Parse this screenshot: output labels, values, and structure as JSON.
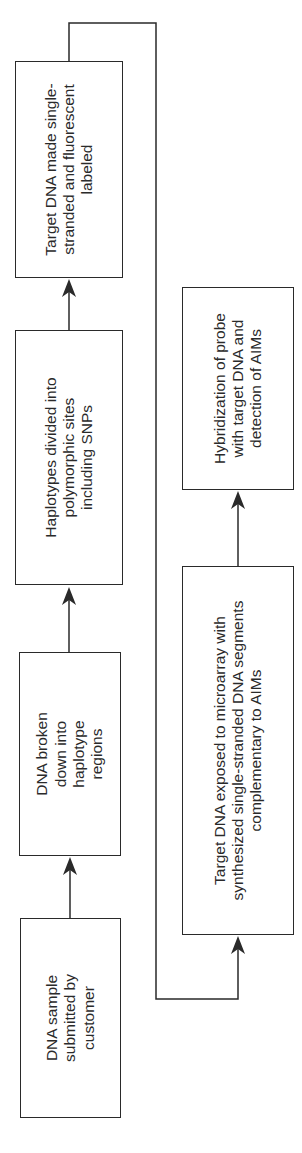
{
  "diagram": {
    "orientation": "rotated-90-ccw",
    "steps": [
      {
        "id": 1,
        "label": "DNA sample submitted by customer"
      },
      {
        "id": 2,
        "label": "DNA broken down into haplotype regions"
      },
      {
        "id": 3,
        "label": "Haplotypes divided into polymorphic sites including SNPs"
      },
      {
        "id": 4,
        "label": "Target DNA made single-stranded and fluorescent labeled"
      },
      {
        "id": 5,
        "label": "Target DNA exposed to microarray with synthesized single-stranded DNA segments complementary to AIMs"
      },
      {
        "id": 6,
        "label": "Hybridization of probe with target DNA and detection of AIMs"
      }
    ],
    "edges": [
      {
        "from": 1,
        "to": 2
      },
      {
        "from": 2,
        "to": 3
      },
      {
        "from": 3,
        "to": 4
      },
      {
        "from": 4,
        "to": 5
      },
      {
        "from": 5,
        "to": 6
      }
    ],
    "line_color": "#2a2a2a"
  }
}
